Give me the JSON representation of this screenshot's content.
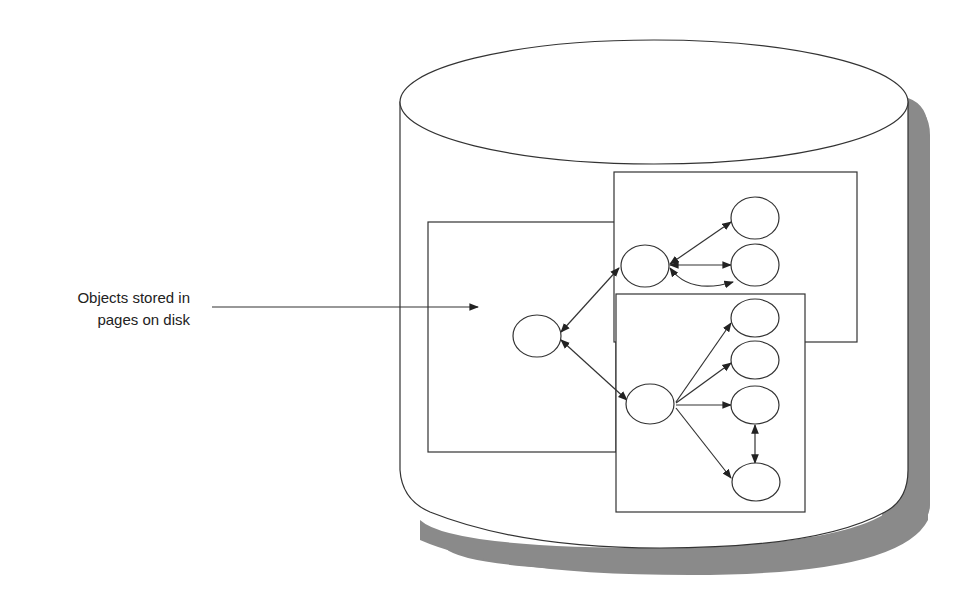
{
  "callout": {
    "line1": "Objects stored in",
    "line2": "pages on disk"
  },
  "diagram": {
    "type": "disk-with-object-pages",
    "colors": {
      "stroke": "#333333",
      "fill": "#ffffff",
      "shadow": "#8a8a8a",
      "text": "#222222"
    },
    "pages": [
      {
        "id": "left-page",
        "x": 428,
        "y": 222,
        "w": 188,
        "h": 230
      },
      {
        "id": "top-right-page",
        "x": 614,
        "y": 172,
        "w": 243,
        "h": 170
      },
      {
        "id": "bottom-right-page",
        "x": 616,
        "y": 294,
        "w": 189,
        "h": 218
      }
    ],
    "nodes": [
      {
        "id": "root",
        "cx": 537,
        "cy": 336
      },
      {
        "id": "upper-hub",
        "cx": 645,
        "cy": 266
      },
      {
        "id": "lower-hub",
        "cx": 650,
        "cy": 404
      },
      {
        "id": "u1",
        "cx": 755,
        "cy": 218
      },
      {
        "id": "u2",
        "cx": 755,
        "cy": 265
      },
      {
        "id": "l1",
        "cx": 755,
        "cy": 318
      },
      {
        "id": "l2",
        "cx": 755,
        "cy": 360
      },
      {
        "id": "l3",
        "cx": 755,
        "cy": 405
      },
      {
        "id": "l4",
        "cx": 756,
        "cy": 482
      }
    ]
  }
}
